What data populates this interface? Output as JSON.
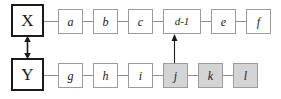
{
  "diagram": {
    "type": "two-row-sequence-diagram",
    "background_color": "#ffffff",
    "node_border_color": "#9b9b9b",
    "anchor_border_color": "#1a1a1a",
    "shaded_fill_color": "#d4d4d4",
    "plain_fill_color": "#ffffff",
    "connector_color": "#8d8d8d",
    "arrow_color": "#1a1a1a",
    "rows": [
      {
        "id": "row-x",
        "anchor": {
          "id": "node-x",
          "label": "X",
          "style": "anchor"
        },
        "nodes": [
          {
            "id": "node-a",
            "label": "a",
            "style": "plain"
          },
          {
            "id": "node-b",
            "label": "b",
            "style": "plain"
          },
          {
            "id": "node-c",
            "label": "c",
            "style": "plain"
          },
          {
            "id": "node-d1",
            "label": "d-1",
            "style": "plain-wide"
          },
          {
            "id": "node-e",
            "label": "e",
            "style": "plain"
          },
          {
            "id": "node-f",
            "label": "f",
            "style": "plain"
          }
        ]
      },
      {
        "id": "row-y",
        "anchor": {
          "id": "node-y",
          "label": "Y",
          "style": "anchor"
        },
        "nodes": [
          {
            "id": "node-g",
            "label": "g",
            "style": "plain"
          },
          {
            "id": "node-h",
            "label": "h",
            "style": "plain"
          },
          {
            "id": "node-i",
            "label": "i",
            "style": "plain"
          },
          {
            "id": "node-j",
            "label": "j",
            "style": "shaded"
          },
          {
            "id": "node-k",
            "label": "k",
            "style": "shaded"
          },
          {
            "id": "node-l",
            "label": "l",
            "style": "shaded"
          }
        ]
      }
    ],
    "arrows": [
      {
        "id": "arrow-x-y",
        "kind": "double-headed-vertical",
        "from": "node-x",
        "to": "node-y"
      },
      {
        "id": "arrow-j-d1",
        "kind": "single-headed-up",
        "from": "node-j",
        "to": "node-d1"
      }
    ]
  }
}
